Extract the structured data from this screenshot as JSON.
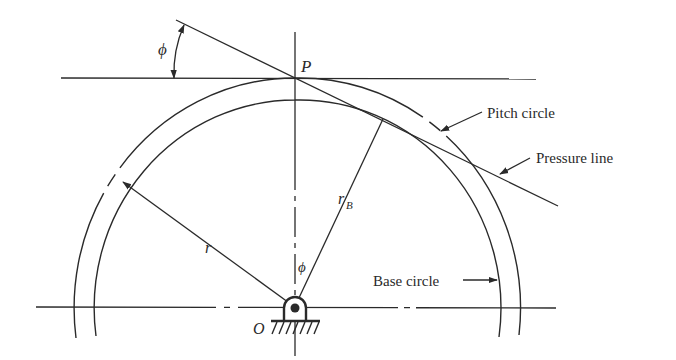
{
  "figure": {
    "type": "gear pitch/base circle diagram",
    "labels": {
      "pitch_point": "P",
      "center": "O",
      "pressure_angle_top": "ϕ",
      "pressure_angle_center": "ϕ",
      "pitch_radius": "r",
      "base_radius_main": "r",
      "base_radius_sub": "B",
      "pitch_circle": "Pitch circle",
      "pressure_line": "Pressure line",
      "base_circle": "Base circle"
    },
    "colors": {
      "ink": "#2a2a2a",
      "background": "#ffffff"
    }
  }
}
